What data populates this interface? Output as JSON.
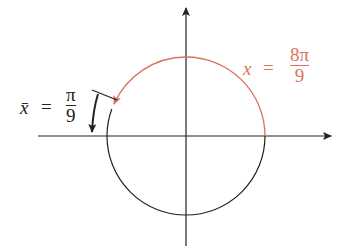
{
  "diagram": {
    "type": "unit-circle-angle",
    "colors": {
      "axis": "#222222",
      "circle": "#222222",
      "arc": "#d9735c",
      "label_red": "#d9735c"
    },
    "angle_label": {
      "lhs": "x",
      "eq": "=",
      "numerator": "8π",
      "denominator": "9"
    },
    "reference_label": {
      "lhs": "x̄",
      "eq": "=",
      "numerator": "π",
      "denominator": "9"
    }
  }
}
